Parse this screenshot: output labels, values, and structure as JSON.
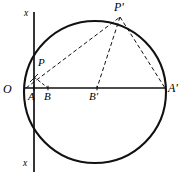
{
  "figure": {
    "background_color": "#ffffff",
    "stroke_color": "#111111",
    "width": 185,
    "height": 183
  },
  "labels": {
    "origin": "O",
    "point_a": "A",
    "point_b": "B",
    "point_b_prime": "B'",
    "point_a_prime": "A'",
    "point_p": "P",
    "point_p_prime": "P'",
    "axis_top": "x",
    "axis_bottom": "x"
  },
  "geometry": {
    "circle": {
      "cx": 95,
      "cy": 92,
      "r": 71
    },
    "points": {
      "O": {
        "x": 26,
        "y": 88
      },
      "A": {
        "x": 34,
        "y": 88
      },
      "B": {
        "x": 48,
        "y": 88
      },
      "B_prime": {
        "x": 97,
        "y": 88
      },
      "A_prime": {
        "x": 165,
        "y": 88
      },
      "P": {
        "x": 34,
        "y": 77
      },
      "P_prime": {
        "x": 120,
        "y": 16
      }
    },
    "vertical_axis": {
      "x": 34,
      "y_top": 12,
      "y_bottom": 172
    },
    "horizontal_diameter": {
      "x1": 25,
      "x2": 166,
      "y": 88
    }
  },
  "segments": [
    {
      "name": "diameter-OA-prime",
      "style": "solid"
    },
    {
      "name": "axis-xx-vertical",
      "style": "solid"
    },
    {
      "name": "circle-outline",
      "style": "solid"
    },
    {
      "name": "chord-O-to-P-prime",
      "style": "dashed"
    },
    {
      "name": "chord-P-prime-to-B-prime",
      "style": "dashed"
    },
    {
      "name": "chord-P-prime-to-A-prime",
      "style": "dashed"
    },
    {
      "name": "segment-O-to-P",
      "style": "dashed"
    },
    {
      "name": "segment-P-to-B",
      "style": "dashed"
    }
  ]
}
